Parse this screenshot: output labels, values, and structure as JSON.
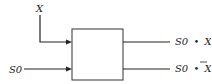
{
  "diagram": {
    "type": "logic-block",
    "inputs": [
      {
        "id": "x",
        "label": "X",
        "direction": "from-top"
      },
      {
        "id": "s0",
        "label": "S0",
        "direction": "from-left"
      }
    ],
    "outputs": [
      {
        "id": "s0-and-x",
        "label_prefix": "S0",
        "operator": "•",
        "label_var": "X",
        "complemented": false
      },
      {
        "id": "s0-and-not-x",
        "label_prefix": "S0",
        "operator": "•",
        "label_var": "X",
        "complemented": true
      }
    ],
    "colors": {
      "line": "#222222",
      "box_border": "#333333",
      "background": "#ffffff"
    }
  }
}
